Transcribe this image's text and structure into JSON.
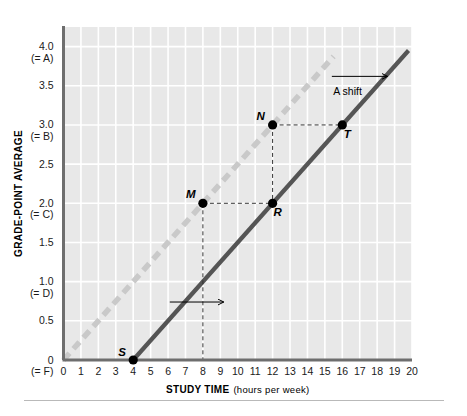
{
  "chart_data": {
    "type": "line",
    "title": "",
    "xlabel": "STUDY TIME",
    "xlabel_sub": "(hours per week)",
    "ylabel": "GRADE-POINT AVERAGE",
    "xlim": [
      0,
      20
    ],
    "ylim": [
      0,
      4.25
    ],
    "grid": true,
    "legend": "none",
    "x_ticks": [
      "0",
      "1",
      "2",
      "3",
      "4",
      "5",
      "6",
      "7",
      "8",
      "9",
      "10",
      "11",
      "12",
      "13",
      "14",
      "15",
      "16",
      "17",
      "18",
      "19",
      "20"
    ],
    "x_tick_values": [
      0,
      1,
      2,
      3,
      4,
      5,
      6,
      7,
      8,
      9,
      10,
      11,
      12,
      13,
      14,
      15,
      16,
      17,
      18,
      19,
      20
    ],
    "y_ticks": [
      {
        "value": 4.0,
        "label": "4.0",
        "sub": "(= A)"
      },
      {
        "value": 3.5,
        "label": "3.5",
        "sub": ""
      },
      {
        "value": 3.0,
        "label": "3.0",
        "sub": "(= B)"
      },
      {
        "value": 2.5,
        "label": "2.5",
        "sub": ""
      },
      {
        "value": 2.0,
        "label": "2.0",
        "sub": "(= C)"
      },
      {
        "value": 1.5,
        "label": "1.5",
        "sub": ""
      },
      {
        "value": 1.0,
        "label": "1.0",
        "sub": "(= D)"
      },
      {
        "value": 0.5,
        "label": "0.5",
        "sub": ""
      },
      {
        "value": 0.0,
        "label": "0",
        "sub": "(= F)"
      }
    ],
    "series": [
      {
        "name": "original-line",
        "style": "dashed",
        "color": "#c9c9c9",
        "x": [
          0,
          15.5
        ],
        "y": [
          0,
          3.875
        ]
      },
      {
        "name": "shifted-line",
        "style": "solid",
        "color": "#555555",
        "x": [
          4,
          19.8
        ],
        "y": [
          0,
          3.95
        ]
      }
    ],
    "points": [
      {
        "label": "S",
        "x": 4,
        "y": 0.0,
        "label_dx": -11,
        "label_dy": -4
      },
      {
        "label": "M",
        "x": 8,
        "y": 2.0,
        "label_dx": -12,
        "label_dy": -5
      },
      {
        "label": "N",
        "x": 12,
        "y": 3.0,
        "label_dx": -12,
        "label_dy": -5
      },
      {
        "label": "R",
        "x": 12,
        "y": 2.0,
        "label_dx": 5,
        "label_dy": 13
      },
      {
        "label": "T",
        "x": 16,
        "y": 3.0,
        "label_dx": 5,
        "label_dy": 13
      }
    ],
    "connectors": [
      {
        "name": "m-to-r",
        "x1": 8,
        "y1": 2.0,
        "x2": 12,
        "y2": 2.0
      },
      {
        "name": "n-to-t",
        "x1": 12,
        "y1": 3.0,
        "x2": 16,
        "y2": 3.0
      },
      {
        "name": "n-to-r",
        "x1": 12,
        "y1": 3.0,
        "x2": 12,
        "y2": 2.0
      },
      {
        "name": "m-to-axis",
        "x1": 8,
        "y1": 2.0,
        "x2": 8,
        "y2": 0.0
      }
    ],
    "annotations": [
      {
        "name": "a-shift",
        "text": "A shift",
        "x": 16.3,
        "y": 3.38,
        "arrow_x1": 15.4,
        "arrow_y1": 3.62,
        "arrow_x2": 18.6,
        "arrow_y2": 3.62
      },
      {
        "name": "lower-shift-arrow",
        "text": "",
        "x": 0,
        "y": 0,
        "arrow_x1": 6.1,
        "arrow_y1": 0.74,
        "arrow_x2": 9.2,
        "arrow_y2": 0.74
      }
    ],
    "colors": {
      "plot_background": "#e8e8e8",
      "gridline": "#ffffff",
      "axis": "#6e6e6e",
      "dashed_line": "#c9c9c9",
      "solid_line": "#555555",
      "point_fill": "#000000",
      "connector": "#333333",
      "text": "#1a1a1a",
      "bottom_rule": "#b9b9b9"
    }
  }
}
